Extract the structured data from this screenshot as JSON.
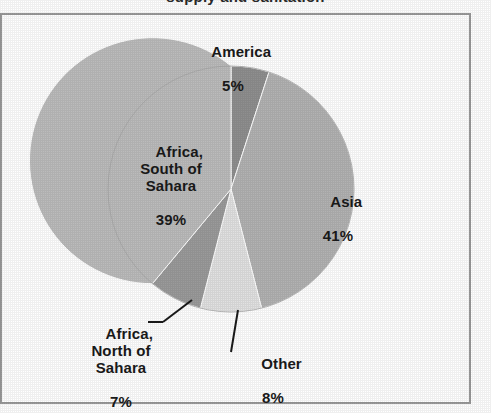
{
  "chart_data": {
    "type": "pie",
    "title": "supply and sanitation",
    "title_note": "clipped at top edge of scan",
    "categories": [
      "America",
      "Asia",
      "Other",
      "Africa, North of Sahara",
      "Africa, South of Sahara"
    ],
    "values": [
      5,
      41,
      8,
      7,
      39
    ],
    "unit": "%",
    "start_angle_deg": 0,
    "direction": "clockwise",
    "legend": "none (labels placed on/near slices)",
    "grid": false,
    "slices": [
      {
        "name": "America",
        "label": "America",
        "value": 5,
        "value_label": "5%",
        "color": "#8f8f8f",
        "label_position": "above-pie",
        "leader_line": false
      },
      {
        "name": "Asia",
        "label": "Asia",
        "value": 41,
        "value_label": "41%",
        "color": "#b3b3b3",
        "label_position": "inside-right",
        "leader_line": false
      },
      {
        "name": "Other",
        "label": "Other",
        "value": 8,
        "value_label": "8%",
        "color": "#e2e2e2",
        "label_position": "below-pie",
        "leader_line": true
      },
      {
        "name": "Africa, North of Sahara",
        "label": "Africa,\nNorth of\nSahara",
        "value": 7,
        "value_label": "7%",
        "color": "#9b9b9b",
        "label_position": "below-left",
        "leader_line": true
      },
      {
        "name": "Africa, South of Sahara",
        "label": "Africa,\nSouth of\nSahara",
        "value": 39,
        "value_label": "39%",
        "color": "#bcbcbc",
        "label_position": "inside-left",
        "leader_line": false
      }
    ]
  },
  "frame": {
    "border_color": "#9a9a9a",
    "background": "#ffffff"
  }
}
